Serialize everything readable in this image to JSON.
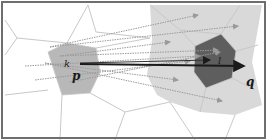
{
  "diagram": {
    "type": "voronoi-ray-casting",
    "labels": {
      "k": "k",
      "p": "p",
      "l": "l",
      "q": "q"
    },
    "colors": {
      "background": "#ffffff",
      "border": "#6e6e6e",
      "cell_edge": "#c8c8c8",
      "light_region": "#d9d9d9",
      "source_cell": "#b8b8b8",
      "target_cell": "#5e5e5e",
      "ray": "#9a9a9a",
      "main_arrow": "#1a1a1a"
    },
    "cells": {
      "source": {
        "name": "k",
        "points": "48,52 67,43 96,48 100,72 90,93 62,95"
      },
      "target": {
        "name": "l",
        "points": "195,46 221,34 236,51 232,78 206,88 194,72"
      },
      "light_region": {
        "points": "150,5 262,5 258,28 252,62 262,105 235,115 200,112 170,102 157,95 147,75 152,40"
      }
    },
    "edges": [
      "5,20 17,38",
      "17,38 67,43",
      "17,38 5,55",
      "67,43 88,5",
      "88,5 96,32",
      "96,32 150,38",
      "96,48 150,38",
      "5,95 48,90",
      "62,95 60,140",
      "90,93 125,112",
      "125,112 115,140",
      "125,112 170,102",
      "170,102 195,140",
      "235,115 225,140",
      "150,5 180,30",
      "180,30 221,34",
      "180,30 195,46",
      "221,34 240,5",
      "236,51 258,45",
      "232,78 255,90",
      "206,88 200,112"
    ],
    "rays": [
      {
        "x1": 50,
        "y1": 47,
        "x2": 198,
        "y2": 15
      },
      {
        "x1": 50,
        "y1": 47,
        "x2": 238,
        "y2": 26
      },
      {
        "x1": 60,
        "y1": 56,
        "x2": 170,
        "y2": 42
      },
      {
        "x1": 60,
        "y1": 56,
        "x2": 218,
        "y2": 50
      },
      {
        "x1": 25,
        "y1": 66,
        "x2": 200,
        "y2": 56
      },
      {
        "x1": 45,
        "y1": 63,
        "x2": 178,
        "y2": 80
      },
      {
        "x1": 45,
        "y1": 63,
        "x2": 222,
        "y2": 101
      },
      {
        "x1": 35,
        "y1": 80,
        "x2": 190,
        "y2": 61
      },
      {
        "x1": 70,
        "y1": 82,
        "x2": 220,
        "y2": 52
      }
    ],
    "main_arrow": {
      "x1": 80,
      "y1": 64,
      "x2": 244,
      "y2": 66
    },
    "secondary_arrow": {
      "x1": 80,
      "y1": 63,
      "x2": 210,
      "y2": 60
    },
    "label_positions": {
      "k": {
        "x": 64,
        "y": 67
      },
      "p": {
        "x": 72,
        "y": 80
      },
      "l": {
        "x": 218,
        "y": 64
      },
      "q": {
        "x": 246,
        "y": 86
      }
    }
  }
}
